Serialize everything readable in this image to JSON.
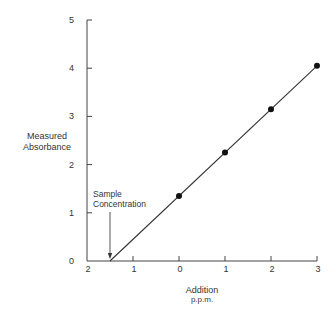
{
  "chart_data": {
    "type": "scatter",
    "title": "",
    "ylabel": [
      "Measured",
      "Absorbance"
    ],
    "xlabel": [
      "Addition",
      "p.p.m."
    ],
    "xlim": [
      -2,
      3
    ],
    "ylim": [
      0,
      5
    ],
    "grid": false,
    "x_ticks": [
      -2,
      -1,
      0,
      1,
      2,
      3
    ],
    "x_tick_labels": [
      "2",
      "1",
      "0",
      "1",
      "2",
      "3"
    ],
    "y_ticks": [
      0,
      1,
      2,
      3,
      4,
      5
    ],
    "y_tick_labels": [
      "0",
      "1",
      "2",
      "3",
      "4",
      "5"
    ],
    "series": [
      {
        "name": "standard additions",
        "points": [
          {
            "x": 0,
            "y": 1.35
          },
          {
            "x": 1,
            "y": 2.25
          },
          {
            "x": 2,
            "y": 3.15
          },
          {
            "x": 3,
            "y": 4.05
          }
        ]
      }
    ],
    "fit_line": {
      "x_start": -1.5,
      "y_start": 0,
      "x_end": 3,
      "y_end": 4.05
    },
    "annotation": {
      "text": [
        "Sample",
        "Concentration"
      ],
      "points_to_x": -1.5
    }
  }
}
